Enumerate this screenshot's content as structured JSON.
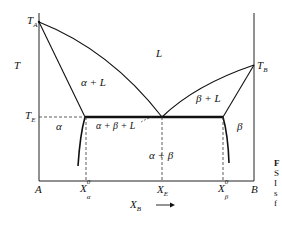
{
  "diagram": {
    "type": "binary eutectic phase diagram",
    "axes": {
      "y_label": "T",
      "x_label": "X",
      "x_label_sub": "B",
      "x_arrow": "⟶",
      "left_component": "A",
      "right_component": "B"
    },
    "points": {
      "ta": {
        "main": "T",
        "sub": "A"
      },
      "tb": {
        "main": "T",
        "sub": "B"
      },
      "te": {
        "main": "T",
        "sub": "E"
      }
    },
    "ticks": {
      "x_alpha": {
        "main": "X",
        "sub": "α",
        "sup": "0"
      },
      "x_e": {
        "main": "X",
        "sub": "E"
      },
      "x_beta": {
        "main": "X",
        "sub": "β",
        "sup": "0"
      }
    },
    "regions": {
      "liquid": "L",
      "alpha_liquid": "α + L",
      "beta_liquid": "β + L",
      "alpha": "α",
      "beta": "β",
      "three_phase": "α + β + L",
      "alpha_beta": "α + β"
    },
    "caption_fragment": [
      "F",
      "S",
      "I",
      "s",
      "f"
    ]
  }
}
